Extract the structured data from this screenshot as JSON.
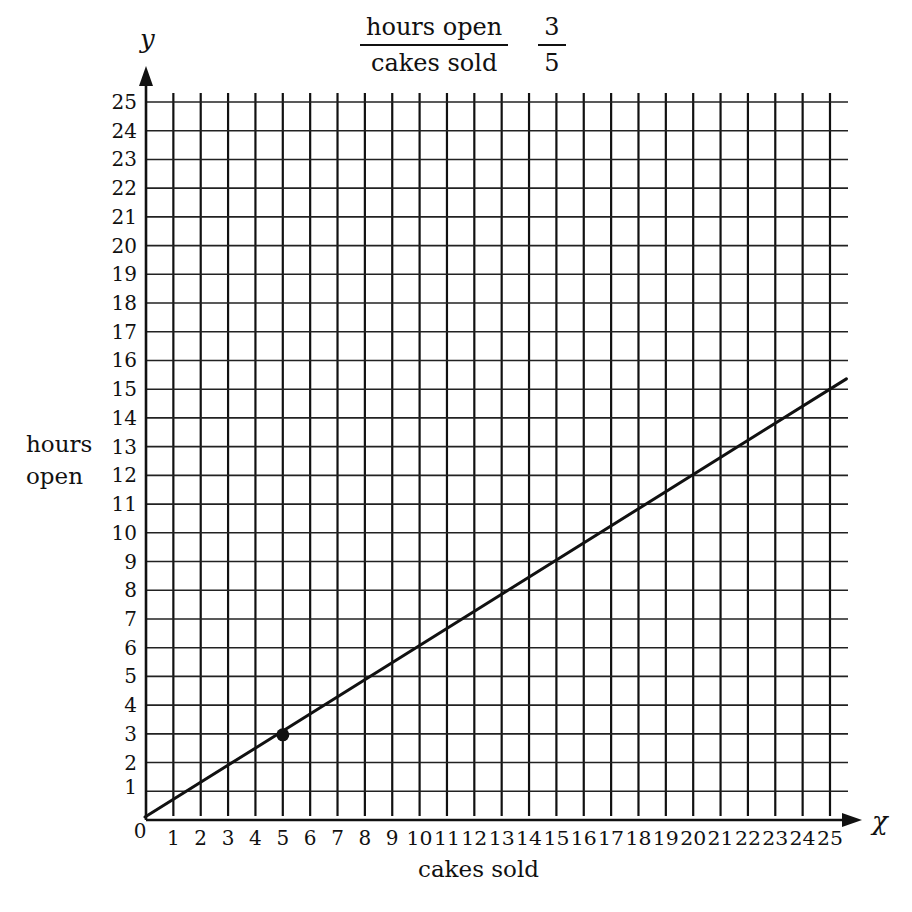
{
  "chart_data": {
    "type": "line",
    "title_fraction": {
      "numerator": "hours open",
      "denominator": "cakes sold"
    },
    "ratio_fraction": {
      "numerator": "3",
      "denominator": "5"
    },
    "xlabel": "cakes sold",
    "ylabel": "hours open",
    "x_variable": "χ",
    "y_variable": "y",
    "xlim": [
      0,
      25
    ],
    "ylim": [
      0,
      25
    ],
    "grid": true,
    "x_ticks": [
      "0",
      "1",
      "2",
      "3",
      "4",
      "5",
      "6",
      "7",
      "8",
      "9",
      "10",
      "11",
      "12",
      "13",
      "14",
      "15",
      "16",
      "17",
      "18",
      "19",
      "20",
      "21",
      "22",
      "23",
      "24",
      "25"
    ],
    "y_ticks": [
      "1",
      "2",
      "3",
      "4",
      "5",
      "6",
      "7",
      "8",
      "9",
      "10",
      "11",
      "12",
      "13",
      "14",
      "15",
      "16",
      "17",
      "18",
      "19",
      "20",
      "21",
      "22",
      "23",
      "24",
      "25"
    ],
    "series": [
      {
        "name": "proportional line",
        "slope": 0.6,
        "x": [
          0,
          25.6
        ],
        "y": [
          0,
          15.36
        ]
      }
    ],
    "points": [
      {
        "x": 5,
        "y": 3
      }
    ]
  },
  "labels": {
    "title_num": "hours open",
    "title_den": "cakes sold",
    "ratio_num": "3",
    "ratio_den": "5",
    "ylabel_line1": "hours",
    "ylabel_line2": "open",
    "xlabel": "cakes sold",
    "x_var": "χ",
    "y_var": "y"
  }
}
